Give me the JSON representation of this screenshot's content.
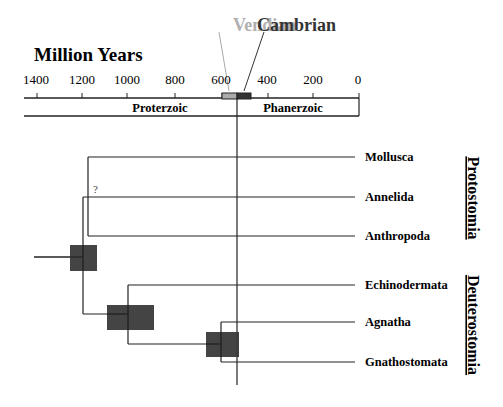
{
  "axis": {
    "title": "Million Years",
    "ticks": [
      {
        "label": "1400",
        "value": 1400
      },
      {
        "label": "1200",
        "value": 1200
      },
      {
        "label": "1000",
        "value": 1000
      },
      {
        "label": "800",
        "value": 800
      },
      {
        "label": "600",
        "value": 600
      },
      {
        "label": "400",
        "value": 400
      },
      {
        "label": "200",
        "value": 200
      },
      {
        "label": "0",
        "value": 0
      }
    ],
    "eons": [
      {
        "name": "Proterzoic"
      },
      {
        "name": "Phanerzoic"
      }
    ],
    "periods": [
      {
        "name": "Vendian",
        "color": "#aaaaaa"
      },
      {
        "name": "Cambrian",
        "color": "#333333"
      }
    ]
  },
  "taxa": [
    {
      "name": "Mollusca"
    },
    {
      "name": "Annelida"
    },
    {
      "name": "Anthropoda"
    },
    {
      "name": "Echinodermata"
    },
    {
      "name": "Agnatha"
    },
    {
      "name": "Gnathostomata"
    }
  ],
  "groups": [
    {
      "name": "Protostomia"
    },
    {
      "name": "Deuterostomia"
    }
  ],
  "annotations": {
    "uncertain_marker": "?"
  },
  "colors": {
    "line": "#222222",
    "node_box": "#3a3a3a",
    "vendian": "#aaaaaa",
    "cambrian": "#333333"
  }
}
